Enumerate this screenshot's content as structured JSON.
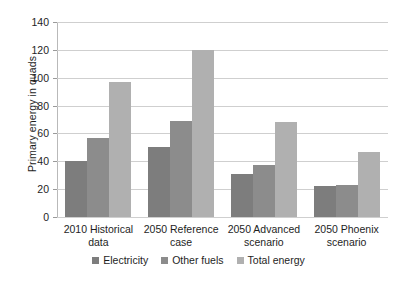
{
  "chart_data": {
    "type": "bar",
    "title": "",
    "subtitle": "",
    "xlabel": "",
    "ylabel": "Primary energy in quads",
    "ylim": [
      0,
      140
    ],
    "ytick_values": [
      0,
      20,
      40,
      60,
      80,
      100,
      120,
      140
    ],
    "ytick_labels": [
      "0",
      "20",
      "40",
      "60",
      "80",
      "100",
      "120",
      "140"
    ],
    "grid": true,
    "legend_position": "bottom",
    "categories": [
      "2010 Historical data",
      "2050 Reference case",
      "2050 Advanced scenario",
      "2050 Phoenix scenario"
    ],
    "category_lines": [
      [
        "2010 Historical",
        "data"
      ],
      [
        "2050 Reference",
        "case"
      ],
      [
        "2050 Advanced",
        "scenario"
      ],
      [
        "2050 Phoenix",
        "scenario"
      ]
    ],
    "series": [
      {
        "name": "Electricity",
        "color": "#7d7d7d",
        "values": [
          40,
          50,
          31,
          22
        ]
      },
      {
        "name": "Other fuels",
        "color": "#8c8c8c",
        "values": [
          57,
          69,
          37,
          23
        ]
      },
      {
        "name": "Total energy",
        "color": "#b0b0b0",
        "values": [
          97,
          120,
          68,
          47
        ]
      }
    ]
  },
  "legend": {
    "items": [
      {
        "label": "Electricity"
      },
      {
        "label": "Other fuels"
      },
      {
        "label": "Total energy"
      }
    ]
  }
}
